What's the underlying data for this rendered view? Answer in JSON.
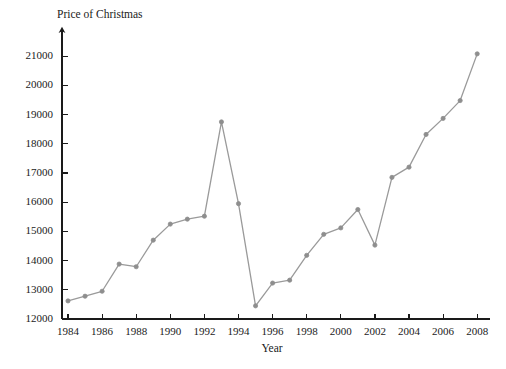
{
  "chart_data": {
    "type": "line",
    "title": "",
    "ylabel": "Price of Christmas",
    "xlabel": "Year",
    "x": [
      1984,
      1985,
      1986,
      1987,
      1988,
      1989,
      1990,
      1991,
      1992,
      1993,
      1994,
      1995,
      1996,
      1997,
      1998,
      1999,
      2000,
      2001,
      2002,
      2003,
      2004,
      2005,
      2006,
      2007,
      2008
    ],
    "values": [
      12620,
      12780,
      12950,
      13880,
      13790,
      14700,
      15250,
      15420,
      15520,
      18750,
      15950,
      12450,
      13230,
      13330,
      14180,
      14900,
      15120,
      15750,
      14530,
      16850,
      17200,
      18320,
      18870,
      19480,
      21080
    ],
    "categories": [
      "1984",
      "1985",
      "1986",
      "1987",
      "1988",
      "1989",
      "1990",
      "1991",
      "1992",
      "1993",
      "1994",
      "1995",
      "1996",
      "1997",
      "1998",
      "1999",
      "2000",
      "2001",
      "2002",
      "2003",
      "2004",
      "2005",
      "2006",
      "2007",
      "2008"
    ],
    "series": [
      {
        "name": "Price of Christmas",
        "values": [
          12620,
          12780,
          12950,
          13880,
          13790,
          14700,
          15250,
          15420,
          15520,
          18750,
          15950,
          12450,
          13230,
          13330,
          14180,
          14900,
          15120,
          15750,
          14530,
          16850,
          17200,
          18320,
          18870,
          19480,
          21080
        ]
      }
    ],
    "xlim": [
      1983.4,
      2008.8
    ],
    "ylim": [
      12000,
      21350
    ],
    "ytick_labels": [
      "12000",
      "13000",
      "14000",
      "15000",
      "16000",
      "17000",
      "18000",
      "19000",
      "20000",
      "21000"
    ],
    "ytick_values": [
      12000,
      13000,
      14000,
      15000,
      16000,
      17000,
      18000,
      19000,
      20000,
      21000
    ],
    "xtick_labels": [
      "1984",
      "1986",
      "1988",
      "1990",
      "1992",
      "1994",
      "1996",
      "1998",
      "2000",
      "2002",
      "2004",
      "2006",
      "2008"
    ],
    "xtick_values": [
      1984,
      1986,
      1988,
      1990,
      1992,
      1994,
      1996,
      1998,
      2000,
      2002,
      2004,
      2006,
      2008
    ],
    "grid": false,
    "legend": false,
    "legend_position": "none",
    "line_color": "#9a9a9a",
    "marker_color": "#8e8e8e",
    "axis_color": "#1a1a1a",
    "background_color": "#ffffff",
    "marker": "circle",
    "y_axis_has_arrow": true
  }
}
